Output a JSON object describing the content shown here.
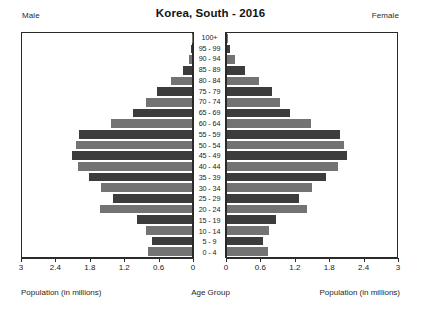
{
  "header": {
    "title": "Korea, South - 2016",
    "male_label": "Male",
    "female_label": "Female"
  },
  "footer": {
    "left": "Population (in millions)",
    "center": "Age Group",
    "right": "Population (in millions)"
  },
  "axis": {
    "left_ticks": [
      "3",
      "2.4",
      "1.8",
      "1.2",
      "0.6",
      "0"
    ],
    "right_ticks": [
      "0",
      "0.6",
      "1.2",
      "1.8",
      "2.4",
      "3"
    ],
    "max": 3,
    "tick_step": 0.6
  },
  "style": {
    "bar_dark": "#3c3c3c",
    "bar_light": "#737373",
    "frame": "#2a2a2a",
    "background": "#ffffff"
  },
  "chart_data": {
    "type": "bar",
    "subtype": "population-pyramid",
    "title": "Korea, South - 2016",
    "xlabel": "Population (in millions)",
    "ylabel": "Age Group",
    "xlim": [
      0,
      3
    ],
    "grid": false,
    "legend_position": "top-corners",
    "categories": [
      "100+",
      "95 - 99",
      "90 - 94",
      "85 - 89",
      "80 - 84",
      "75 - 79",
      "70 - 74",
      "65 - 69",
      "60 - 64",
      "55 - 59",
      "50 - 54",
      "45 - 49",
      "40 - 44",
      "35 - 39",
      "30 - 34",
      "25 - 29",
      "20 - 24",
      "15 - 19",
      "10 - 14",
      "5 - 9",
      "0 - 4"
    ],
    "series": [
      {
        "name": "Male",
        "side": "left",
        "values": [
          0.003,
          0.012,
          0.05,
          0.16,
          0.37,
          0.62,
          0.82,
          1.04,
          1.43,
          1.99,
          2.05,
          2.11,
          2.01,
          1.81,
          1.61,
          1.4,
          1.62,
          0.97,
          0.81,
          0.7,
          0.78
        ]
      },
      {
        "name": "Female",
        "side": "right",
        "values": [
          0.012,
          0.05,
          0.14,
          0.31,
          0.57,
          0.79,
          0.94,
          1.12,
          1.48,
          2.0,
          2.06,
          2.12,
          1.96,
          1.74,
          1.5,
          1.27,
          1.42,
          0.87,
          0.74,
          0.64,
          0.73
        ]
      }
    ]
  }
}
